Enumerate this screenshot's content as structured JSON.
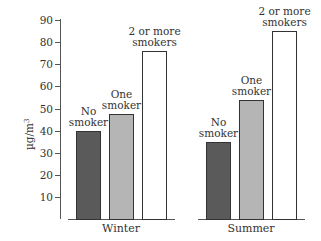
{
  "chart_data": {
    "type": "bar",
    "title": "",
    "xlabel": "",
    "ylabel": "µg/m³",
    "ylim": [
      0,
      90
    ],
    "yticks": [
      10,
      20,
      30,
      40,
      50,
      60,
      70,
      80,
      90
    ],
    "grid": false,
    "legend": "none (bars labeled directly)",
    "categories": [
      "Winter",
      "Summer"
    ],
    "series": [
      {
        "name": "No smoker",
        "label_lines": [
          "No",
          "smoker"
        ],
        "color": "#5a5a5a",
        "values": [
          40,
          35
        ]
      },
      {
        "name": "One smoker",
        "label_lines": [
          "One",
          "smoker"
        ],
        "color": "#b5b5b5",
        "values": [
          47.5,
          54
        ]
      },
      {
        "name": "2 or more smokers",
        "label_lines": [
          "2 or more",
          "smokers"
        ],
        "color": "#ffffff",
        "values": [
          76,
          85
        ]
      }
    ]
  },
  "axis": {
    "ylabel_base": "µg/m",
    "ylabel_sup": "3",
    "ticks": [
      "90",
      "80",
      "70",
      "60",
      "50",
      "40",
      "30",
      "20",
      "10"
    ]
  },
  "groups": [
    {
      "label": "Winter",
      "bars": [
        {
          "line1": "No",
          "line2": "smoker"
        },
        {
          "line1": "One",
          "line2": "smoker"
        },
        {
          "line1": "2 or more",
          "line2": "smokers"
        }
      ]
    },
    {
      "label": "Summer",
      "bars": [
        {
          "line1": "No",
          "line2": "smoker"
        },
        {
          "line1": "One",
          "line2": "smoker"
        },
        {
          "line1": "2 or more",
          "line2": "smokers"
        }
      ]
    }
  ]
}
